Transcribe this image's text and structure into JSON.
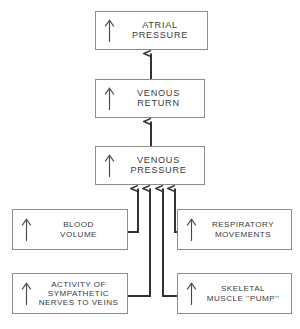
{
  "figure": {
    "type": "flow-diagram",
    "background_color": "#ffffff",
    "box_border_color": "#8d8d8d",
    "connector_color": "#333333",
    "text_color": "#3b3b3b"
  },
  "nodes": [
    {
      "id": "atrial-pressure",
      "label": "ATRIAL PRESSURE",
      "arrow": "up-arrow-icon",
      "direction": "increase"
    },
    {
      "id": "venous-return",
      "label": "VENOUS RETURN",
      "arrow": "up-arrow-icon",
      "direction": "increase"
    },
    {
      "id": "venous-pressure",
      "label": "VENOUS PRESSURE",
      "arrow": "up-arrow-icon",
      "direction": "increase"
    },
    {
      "id": "blood-volume",
      "label": "BLOOD\nVOLUME",
      "arrow": "up-arrow-icon",
      "direction": "increase"
    },
    {
      "id": "respiratory",
      "label": "RESPIRATORY\nMOVEMENTS",
      "arrow": "up-arrow-icon",
      "direction": "increase"
    },
    {
      "id": "sympathetic",
      "label": "ACTIVITY OF\nSYMPATHETIC\nNERVES TO VEINS",
      "arrow": "up-arrow-icon",
      "direction": "increase"
    },
    {
      "id": "skeletal-pump",
      "label": "SKELETAL\nMUSCLE ''PUMP''",
      "arrow": "up-arrow-icon",
      "direction": "increase"
    }
  ],
  "edges": [
    {
      "from": "venous-return",
      "to": "atrial-pressure"
    },
    {
      "from": "venous-pressure",
      "to": "venous-return"
    },
    {
      "from": "blood-volume",
      "to": "venous-pressure"
    },
    {
      "from": "sympathetic",
      "to": "venous-pressure"
    },
    {
      "from": "skeletal-pump",
      "to": "venous-pressure"
    },
    {
      "from": "respiratory",
      "to": "venous-pressure"
    }
  ],
  "caption": {
    "text": ""
  }
}
